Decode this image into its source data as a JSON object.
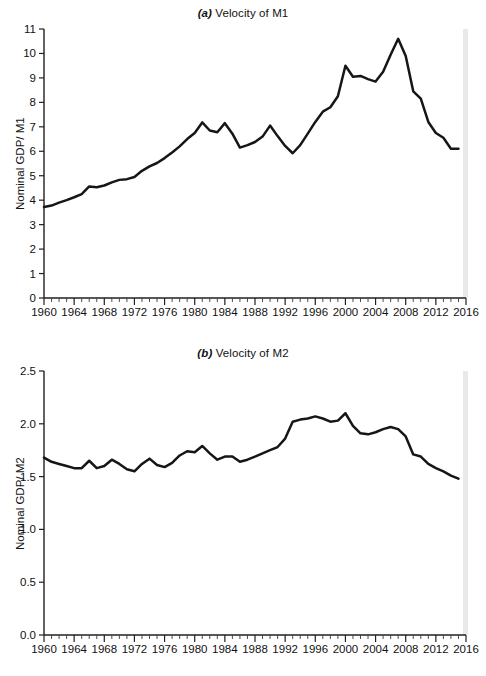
{
  "figure": {
    "background": "#ffffff",
    "line_color": "#161616",
    "axis_color": "#231f20"
  },
  "panels": [
    {
      "id": "a",
      "tag": "(a)",
      "title_text": " Velocity of M1",
      "ylabel": "Nominal GDP/ M1",
      "ytick_labels": [
        "11",
        "10",
        "9",
        "8",
        "7",
        "6",
        "5",
        "4",
        "3",
        "2",
        "1",
        "0"
      ],
      "xtick_labels": [
        "1960",
        "1964",
        "1968",
        "1972",
        "1976",
        "1980",
        "1984",
        "1988",
        "1992",
        "1996",
        "2000",
        "2004",
        "2008",
        "2012",
        "2016"
      ]
    },
    {
      "id": "b",
      "tag": "(b)",
      "title_text": " Velocity of M2",
      "ylabel": "Nominal GDP/ M2",
      "ytick_labels": [
        "2.5",
        "2.0",
        "1.5",
        "1.0",
        "0.5",
        "0.0"
      ],
      "xtick_labels": [
        "1960",
        "1964",
        "1968",
        "1972",
        "1976",
        "1980",
        "1984",
        "1988",
        "1992",
        "1996",
        "2000",
        "2004",
        "2008",
        "2012",
        "2016"
      ]
    }
  ],
  "chart_data": [
    {
      "type": "line",
      "title": "(a) Velocity of M1",
      "xlabel": "",
      "ylabel": "Nominal GDP/ M1",
      "xlim": [
        1960,
        2016
      ],
      "ylim": [
        0,
        11
      ],
      "ytick_values": [
        0,
        1,
        2,
        3,
        4,
        5,
        6,
        7,
        8,
        9,
        10,
        11
      ],
      "xtick_values": [
        1960,
        1964,
        1968,
        1972,
        1976,
        1980,
        1984,
        1988,
        1992,
        1996,
        2000,
        2004,
        2008,
        2012,
        2016
      ],
      "minor_xtick_interval": 1,
      "grid": false,
      "legend": false,
      "series": [
        {
          "name": "Velocity of M1",
          "x": [
            1960,
            1961,
            1962,
            1963,
            1964,
            1965,
            1966,
            1967,
            1968,
            1969,
            1970,
            1971,
            1972,
            1973,
            1974,
            1975,
            1976,
            1977,
            1978,
            1979,
            1980,
            1981,
            1982,
            1983,
            1984,
            1985,
            1986,
            1987,
            1988,
            1989,
            1990,
            1991,
            1992,
            1993,
            1994,
            1995,
            1996,
            1997,
            1998,
            1999,
            2000,
            2001,
            2002,
            2003,
            2004,
            2005,
            2006,
            2007,
            2008,
            2009,
            2010,
            2011,
            2012,
            2013,
            2014,
            2015
          ],
          "y": [
            3.72,
            3.78,
            3.9,
            4.0,
            4.12,
            4.25,
            4.56,
            4.53,
            4.6,
            4.73,
            4.83,
            4.86,
            4.95,
            5.2,
            5.38,
            5.52,
            5.72,
            5.95,
            6.2,
            6.5,
            6.75,
            7.18,
            6.85,
            6.78,
            7.15,
            6.72,
            6.15,
            6.25,
            6.38,
            6.6,
            7.05,
            6.62,
            6.22,
            5.92,
            6.25,
            6.72,
            7.2,
            7.62,
            7.8,
            8.25,
            9.5,
            9.05,
            9.08,
            8.95,
            8.85,
            9.25,
            9.95,
            10.6,
            9.9,
            8.45,
            8.15,
            7.2,
            6.75,
            6.55,
            6.1,
            6.1
          ],
          "annotations": [
            {
              "label": "1981 local peak",
              "x": 1981,
              "y": 7.18
            },
            {
              "label": "1984 local peak",
              "x": 1984,
              "y": 7.15
            },
            {
              "label": "1993 trough",
              "x": 1993,
              "y": 5.92
            },
            {
              "label": "2000 peak",
              "x": 2000,
              "y": 9.5
            },
            {
              "label": "2007 maximum",
              "x": 2007,
              "y": 10.6
            }
          ]
        }
      ]
    },
    {
      "type": "line",
      "title": "(b) Velocity of M2",
      "xlabel": "",
      "ylabel": "Nominal GDP/ M2",
      "xlim": [
        1960,
        2016
      ],
      "ylim": [
        0.0,
        2.5
      ],
      "ytick_values": [
        0.0,
        0.5,
        1.0,
        1.5,
        2.0,
        2.5
      ],
      "xtick_values": [
        1960,
        1964,
        1968,
        1972,
        1976,
        1980,
        1984,
        1988,
        1992,
        1996,
        2000,
        2004,
        2008,
        2012,
        2016
      ],
      "minor_xtick_interval": 1,
      "grid": false,
      "legend": false,
      "series": [
        {
          "name": "Velocity of M2",
          "x": [
            1960,
            1961,
            1962,
            1963,
            1964,
            1965,
            1966,
            1967,
            1968,
            1969,
            1970,
            1971,
            1972,
            1973,
            1974,
            1975,
            1976,
            1977,
            1978,
            1979,
            1980,
            1981,
            1982,
            1983,
            1984,
            1985,
            1986,
            1987,
            1988,
            1989,
            1990,
            1991,
            1992,
            1993,
            1994,
            1995,
            1996,
            1997,
            1998,
            1999,
            2000,
            2001,
            2002,
            2003,
            2004,
            2005,
            2006,
            2007,
            2008,
            2009,
            2010,
            2011,
            2012,
            2013,
            2014,
            2015
          ],
          "y": [
            1.68,
            1.64,
            1.62,
            1.6,
            1.58,
            1.58,
            1.65,
            1.58,
            1.6,
            1.66,
            1.62,
            1.57,
            1.55,
            1.62,
            1.67,
            1.61,
            1.59,
            1.63,
            1.7,
            1.74,
            1.73,
            1.79,
            1.72,
            1.66,
            1.69,
            1.69,
            1.64,
            1.66,
            1.69,
            1.72,
            1.75,
            1.78,
            1.86,
            2.02,
            2.04,
            2.05,
            2.07,
            2.05,
            2.02,
            2.03,
            2.1,
            1.98,
            1.91,
            1.9,
            1.92,
            1.95,
            1.97,
            1.95,
            1.88,
            1.71,
            1.69,
            1.62,
            1.58,
            1.55,
            1.51,
            1.48
          ]
        }
      ]
    }
  ]
}
